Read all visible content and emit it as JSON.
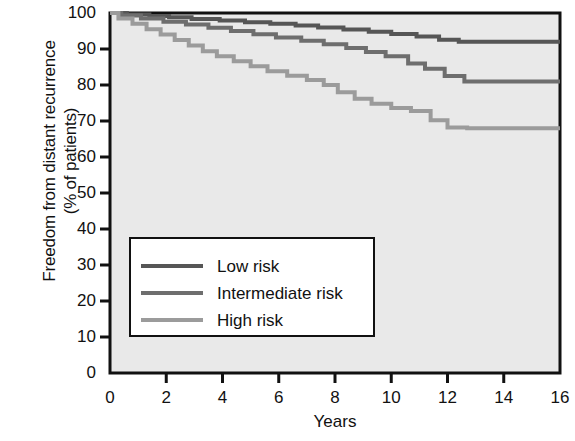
{
  "chart_data": {
    "type": "line",
    "title": "",
    "xlabel": "Years",
    "ylabel_line1": "Freedom from distant recurrence",
    "ylabel_line2": "(% of patients)",
    "xlim": [
      0,
      16
    ],
    "ylim": [
      0,
      100
    ],
    "xticks": [
      "0",
      "2",
      "4",
      "6",
      "8",
      "10",
      "12",
      "14",
      "16"
    ],
    "yticks": [
      "0",
      "10",
      "20",
      "30",
      "40",
      "50",
      "60",
      "70",
      "80",
      "90",
      "100"
    ],
    "grid": false,
    "legend_position": "center-left-inside",
    "plot_background": "#e9e9e9",
    "axis_color": "#111111",
    "series": [
      {
        "name": "Low risk",
        "color": "#565656",
        "points": [
          [
            0,
            100
          ],
          [
            0.6,
            100
          ],
          [
            0.9,
            99.6
          ],
          [
            1.4,
            99.6
          ],
          [
            1.7,
            99.2
          ],
          [
            2.1,
            99.2
          ],
          [
            2.4,
            98.8
          ],
          [
            2.9,
            98.8
          ],
          [
            3.2,
            98.3
          ],
          [
            3.9,
            98.3
          ],
          [
            4.2,
            97.9
          ],
          [
            4.8,
            97.9
          ],
          [
            5.1,
            97.4
          ],
          [
            5.7,
            97.4
          ],
          [
            6.0,
            97.0
          ],
          [
            6.6,
            97.0
          ],
          [
            6.9,
            96.5
          ],
          [
            7.4,
            96.5
          ],
          [
            7.7,
            96.0
          ],
          [
            8.3,
            96.0
          ],
          [
            8.6,
            95.4
          ],
          [
            9.2,
            95.4
          ],
          [
            9.5,
            94.8
          ],
          [
            10.0,
            94.8
          ],
          [
            10.3,
            94.2
          ],
          [
            10.9,
            94.2
          ],
          [
            11.2,
            93.5
          ],
          [
            11.7,
            93.5
          ],
          [
            12.0,
            92.6
          ],
          [
            12.4,
            92.6
          ],
          [
            12.7,
            92.0
          ],
          [
            16,
            92.0
          ]
        ]
      },
      {
        "name": "Intermediate risk",
        "color": "#6e6e6e",
        "points": [
          [
            0,
            100
          ],
          [
            0.4,
            100
          ],
          [
            0.7,
            99.3
          ],
          [
            1.1,
            99.3
          ],
          [
            1.4,
            98.5
          ],
          [
            1.9,
            98.5
          ],
          [
            2.2,
            97.6
          ],
          [
            2.7,
            97.6
          ],
          [
            3.0,
            96.8
          ],
          [
            3.5,
            96.8
          ],
          [
            3.8,
            95.9
          ],
          [
            4.3,
            95.9
          ],
          [
            4.6,
            95.0
          ],
          [
            5.1,
            95.0
          ],
          [
            5.4,
            94.1
          ],
          [
            5.9,
            94.1
          ],
          [
            6.2,
            93.2
          ],
          [
            6.8,
            93.2
          ],
          [
            7.1,
            92.3
          ],
          [
            7.6,
            92.3
          ],
          [
            7.9,
            91.3
          ],
          [
            8.4,
            91.3
          ],
          [
            8.7,
            90.3
          ],
          [
            9.1,
            90.3
          ],
          [
            9.4,
            89.2
          ],
          [
            9.8,
            89.2
          ],
          [
            10.1,
            88.0
          ],
          [
            10.6,
            88.0
          ],
          [
            10.9,
            86.0
          ],
          [
            11.2,
            86.0
          ],
          [
            11.5,
            84.5
          ],
          [
            11.9,
            84.5
          ],
          [
            12.2,
            82.5
          ],
          [
            12.6,
            82.5
          ],
          [
            12.9,
            81.0
          ],
          [
            16,
            81.0
          ]
        ]
      },
      {
        "name": "High risk",
        "color": "#9b9b9b",
        "points": [
          [
            0,
            100
          ],
          [
            0.3,
            100
          ],
          [
            0.5,
            98.5
          ],
          [
            0.8,
            98.5
          ],
          [
            1.0,
            97.0
          ],
          [
            1.3,
            97.0
          ],
          [
            1.5,
            95.5
          ],
          [
            1.8,
            95.5
          ],
          [
            2.0,
            94.0
          ],
          [
            2.3,
            94.0
          ],
          [
            2.5,
            92.5
          ],
          [
            2.8,
            92.5
          ],
          [
            3.0,
            91.0
          ],
          [
            3.3,
            91.0
          ],
          [
            3.5,
            89.4
          ],
          [
            3.8,
            89.4
          ],
          [
            4.0,
            88.0
          ],
          [
            4.4,
            88.0
          ],
          [
            4.6,
            86.6
          ],
          [
            5.0,
            86.6
          ],
          [
            5.2,
            85.2
          ],
          [
            5.6,
            85.2
          ],
          [
            5.8,
            83.8
          ],
          [
            6.3,
            83.8
          ],
          [
            6.5,
            82.6
          ],
          [
            7.0,
            82.6
          ],
          [
            7.2,
            81.4
          ],
          [
            7.6,
            81.4
          ],
          [
            7.8,
            80.0
          ],
          [
            8.1,
            80.0
          ],
          [
            8.3,
            78.0
          ],
          [
            8.7,
            78.0
          ],
          [
            8.9,
            76.2
          ],
          [
            9.3,
            76.2
          ],
          [
            9.5,
            74.8
          ],
          [
            10.0,
            74.8
          ],
          [
            10.2,
            73.6
          ],
          [
            10.7,
            73.6
          ],
          [
            10.9,
            72.8
          ],
          [
            11.4,
            72.8
          ],
          [
            11.6,
            70.2
          ],
          [
            12.0,
            70.2
          ],
          [
            12.2,
            68.2
          ],
          [
            12.7,
            68.2
          ],
          [
            12.9,
            68.0
          ],
          [
            16,
            68.0
          ]
        ]
      }
    ]
  },
  "legend": {
    "entries": [
      {
        "label": "Low risk",
        "color": "#565656"
      },
      {
        "label": "Intermediate risk",
        "color": "#6e6e6e"
      },
      {
        "label": "High risk",
        "color": "#9b9b9b"
      }
    ]
  }
}
